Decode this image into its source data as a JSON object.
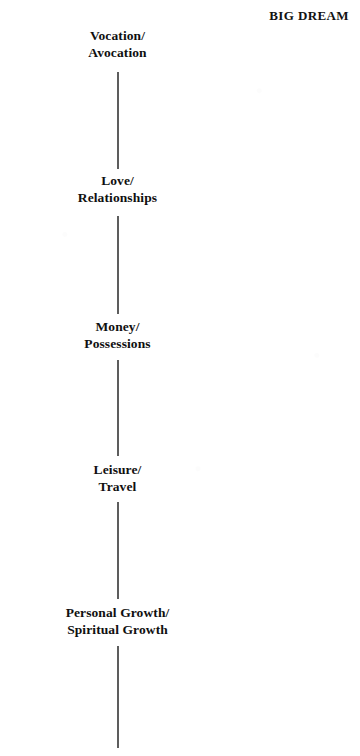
{
  "header": {
    "title": "BIG DREAM"
  },
  "diagram": {
    "type": "vertical-spine-list",
    "line_color": "#5d5d5d",
    "text_color": "#101010",
    "background": "#ffffff",
    "center_x": 117,
    "nodes": [
      {
        "id": "vocation",
        "line1": "Vocation/",
        "line2": "Avocation",
        "label_top": 27
      },
      {
        "id": "love",
        "line1": "Love/",
        "line2": "Relationships",
        "label_top": 172
      },
      {
        "id": "money",
        "line1": "Money/",
        "line2": "Possessions",
        "label_top": 318
      },
      {
        "id": "leisure",
        "line1": "Leisure/",
        "line2": "Travel",
        "label_top": 461
      },
      {
        "id": "growth",
        "line1": "Personal Growth/",
        "line2": "Spiritual Growth",
        "label_top": 604
      }
    ],
    "segments": [
      {
        "id": "segment-1",
        "top": 72,
        "height": 97
      },
      {
        "id": "segment-2",
        "top": 216,
        "height": 98
      },
      {
        "id": "segment-3",
        "top": 360,
        "height": 96
      },
      {
        "id": "segment-4",
        "top": 502,
        "height": 97
      },
      {
        "id": "segment-5",
        "top": 646,
        "height": 102
      }
    ]
  }
}
